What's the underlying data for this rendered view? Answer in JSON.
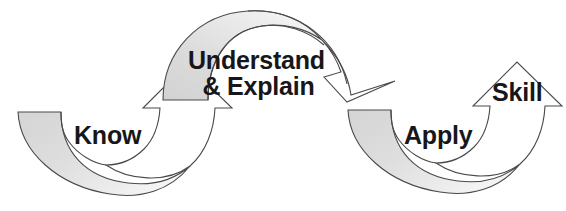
{
  "diagram": {
    "type": "process-flow",
    "background_color": "#ffffff",
    "band_fill_color": "#dcdcdc",
    "band_fill_color_light": "#f2f2f2",
    "arrowhead_fill_color": "#ffffff",
    "outline_color": "#3a3a3a",
    "text_color": "#17171a",
    "stages": [
      {
        "id": "know",
        "label": "Know",
        "order": 1,
        "position": "lower-left"
      },
      {
        "id": "understand-explain",
        "label_line_1": "Understand",
        "label_line_2": "& Explain",
        "order": 2,
        "position": "upper-center-left"
      },
      {
        "id": "apply",
        "label": "Apply",
        "order": 3,
        "position": "lower-right"
      },
      {
        "id": "skill",
        "label": "Skill",
        "order": 4,
        "position": "upper-right"
      }
    ],
    "arrows": [
      {
        "id": "arrow-know-to-understand",
        "from": "know",
        "to": "understand-explain",
        "shape": "u-curve-upward",
        "direction": "up-right",
        "head": "up"
      },
      {
        "id": "arrow-understand-to-apply",
        "from": "understand-explain",
        "to": "apply",
        "shape": "arch-downward",
        "direction": "down-right",
        "head": "down-right"
      },
      {
        "id": "arrow-apply-to-skill",
        "from": "apply",
        "to": "skill",
        "shape": "u-curve-upward",
        "direction": "up-right",
        "head": "up"
      }
    ]
  }
}
